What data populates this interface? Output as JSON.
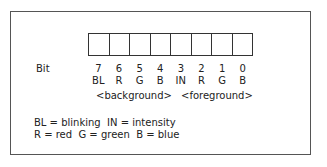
{
  "diagram": {
    "bit_label": "Bit",
    "bits": [
      {
        "number": "7",
        "code": "BL"
      },
      {
        "number": "6",
        "code": "R"
      },
      {
        "number": "5",
        "code": "G"
      },
      {
        "number": "4",
        "code": "B"
      },
      {
        "number": "3",
        "code": "IN"
      },
      {
        "number": "2",
        "code": "R"
      },
      {
        "number": "1",
        "code": "G"
      },
      {
        "number": "0",
        "code": "B"
      }
    ],
    "groups": {
      "background": "<background>",
      "foreground": "<foreground>"
    },
    "legend": {
      "line1": "BL = blinking  IN = intensity",
      "line2": "R = red  G = green  B = blue"
    }
  }
}
